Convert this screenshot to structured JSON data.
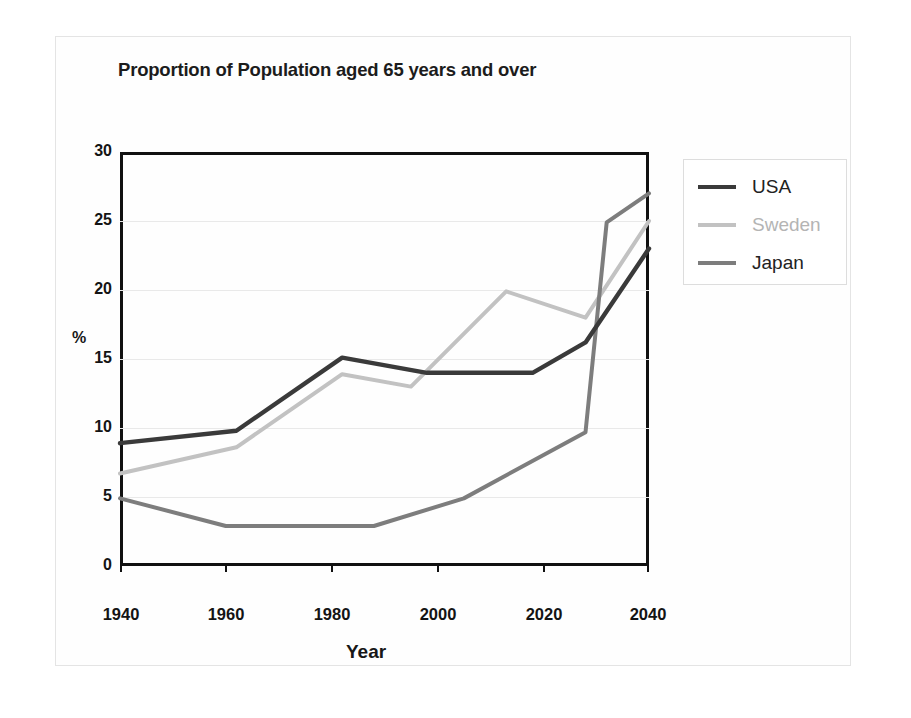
{
  "chart_data": {
    "type": "line",
    "title": "Proportion of Population aged 65 years and over",
    "xlabel": "Year",
    "ylabel": "%",
    "xlim": [
      1940,
      2040
    ],
    "ylim": [
      0,
      30
    ],
    "xticks": [
      "1940",
      "1960",
      "1980",
      "2000",
      "2020",
      "2040"
    ],
    "yticks": [
      "0",
      "5",
      "10",
      "15",
      "20",
      "25",
      "30"
    ],
    "grid": true,
    "legend_position": "right",
    "series": [
      {
        "name": "USA",
        "color": "#3a3a3a",
        "x": [
          1940,
          1962,
          1982,
          1998,
          2018,
          2028,
          2040
        ],
        "y": [
          8.9,
          9.8,
          15.1,
          14.0,
          14.0,
          16.2,
          23.0
        ]
      },
      {
        "name": "Sweden",
        "color": "#c2c2c2",
        "x": [
          1940,
          1962,
          1982,
          1995,
          2013,
          2028,
          2040
        ],
        "y": [
          6.7,
          8.6,
          13.9,
          13.0,
          19.9,
          18.0,
          25.0
        ]
      },
      {
        "name": "Japan",
        "color": "#7d7d7d",
        "x": [
          1940,
          1960,
          1988,
          2005,
          2028,
          2032,
          2040
        ],
        "y": [
          4.9,
          2.9,
          2.9,
          4.9,
          9.7,
          24.9,
          27.0
        ]
      }
    ]
  },
  "legend": {
    "entries": [
      {
        "label": "USA"
      },
      {
        "label": "Sweden"
      },
      {
        "label": "Japan"
      }
    ]
  }
}
